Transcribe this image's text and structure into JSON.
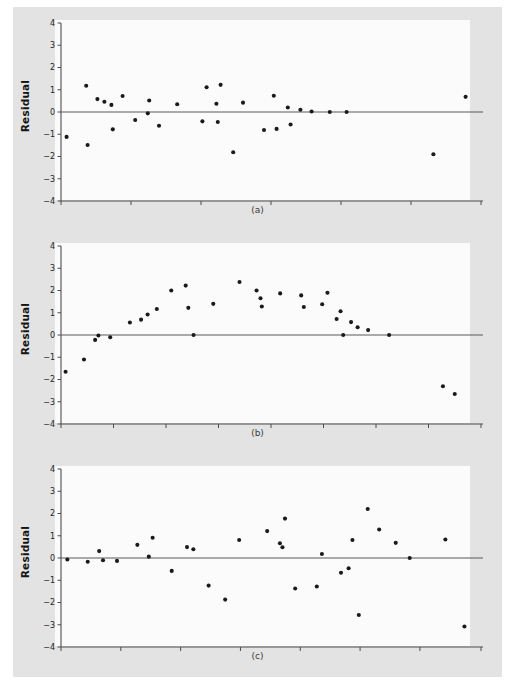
{
  "figure": {
    "background_color": "#e3e3e3",
    "panel_background_color": "#fbfbfb",
    "axis_color": "#4d4d4d",
    "point_color": "#1a1a1a",
    "y_axis_label": "Residual",
    "y_ticks": [
      "4",
      "3",
      "2",
      "1",
      "0",
      "-1",
      "-2",
      "-3",
      "-4"
    ]
  },
  "panels": [
    {
      "caption": "(a)",
      "y_axis_label": "Residual",
      "chart_data": {
        "type": "scatter",
        "title": "",
        "xlabel": "",
        "ylabel": "Residual",
        "ylim": [
          -4,
          4
        ],
        "xlim": [
          0,
          30
        ],
        "yticks": [
          -4,
          -3,
          -2,
          -1,
          0,
          1,
          2,
          3,
          4
        ],
        "ytick_labels": [
          "-4",
          "-3",
          "-2",
          "-1",
          "0",
          "1",
          "2",
          "3",
          "4"
        ],
        "xticks": [
          0,
          5,
          10,
          15,
          20,
          25,
          30
        ],
        "xtick_labels": [
          "",
          "",
          "",
          "",
          "",
          "",
          ""
        ],
        "grid": false,
        "legend": "none",
        "reference_line_y": 0,
        "x": [
          0.4,
          1.8,
          1.9,
          2.6,
          3.1,
          3.6,
          3.7,
          4.4,
          5.3,
          6.2,
          6.3,
          7.0,
          8.3,
          10.1,
          10.4,
          11.1,
          11.2,
          11.4,
          12.3,
          13.0,
          14.5,
          15.2,
          15.4,
          16.2,
          16.4,
          17.1,
          17.9,
          19.2,
          20.4,
          26.6,
          28.9
        ],
        "y": [
          -1.12,
          1.18,
          -1.48,
          0.58,
          0.46,
          0.32,
          -0.78,
          0.72,
          -0.36,
          -0.06,
          0.52,
          -0.62,
          0.35,
          -0.42,
          1.11,
          0.37,
          -0.45,
          1.22,
          -1.81,
          0.42,
          -0.81,
          0.73,
          -0.76,
          0.2,
          -0.56,
          0.1,
          0.02,
          0.0,
          0.0,
          -1.9,
          0.68
        ]
      }
    },
    {
      "caption": "(b)",
      "y_axis_label": "Residual",
      "chart_data": {
        "type": "scatter",
        "title": "",
        "xlabel": "",
        "ylabel": "Residual",
        "ylim": [
          -4,
          4
        ],
        "xlim": [
          0,
          32
        ],
        "yticks": [
          -4,
          -3,
          -2,
          -1,
          0,
          1,
          2,
          3,
          4
        ],
        "ytick_labels": [
          "-4",
          "-3",
          "-2",
          "-1",
          "0",
          "1",
          "2",
          "3",
          "4"
        ],
        "xticks": [
          0,
          4,
          8,
          12,
          16,
          20,
          24,
          28,
          32
        ],
        "xtick_labels": [
          "",
          "",
          "",
          "",
          "",
          "",
          "",
          "",
          ""
        ],
        "grid": false,
        "legend": "none",
        "reference_line_y": 0,
        "x": [
          0.35,
          1.75,
          2.6,
          2.85,
          3.75,
          5.25,
          6.1,
          6.6,
          7.3,
          8.4,
          9.5,
          9.7,
          10.1,
          11.6,
          13.6,
          14.9,
          15.2,
          15.3,
          16.7,
          18.3,
          18.5,
          19.9,
          20.3,
          21.0,
          21.3,
          21.5,
          22.1,
          22.6,
          23.4,
          25.0,
          29.1,
          30.0
        ],
        "y": [
          -1.65,
          -1.1,
          -0.22,
          -0.02,
          -0.1,
          0.56,
          0.69,
          0.92,
          1.17,
          2.0,
          2.22,
          1.22,
          0.0,
          1.4,
          2.38,
          2.0,
          1.65,
          1.28,
          1.87,
          1.78,
          1.26,
          1.38,
          1.9,
          0.72,
          1.07,
          0.0,
          0.58,
          0.35,
          0.22,
          0.0,
          -2.3,
          -2.65
        ]
      }
    },
    {
      "caption": "(c)",
      "y_axis_label": "Residual",
      "chart_data": {
        "type": "scatter",
        "title": "",
        "xlabel": "",
        "ylabel": "Residual",
        "ylim": [
          -4,
          4
        ],
        "xlim": [
          0,
          33
        ],
        "yticks": [
          -4,
          -3,
          -2,
          -1,
          0,
          1,
          2,
          3,
          4
        ],
        "ytick_labels": [
          "-4",
          "-3",
          "-2",
          "-1",
          "0",
          "1",
          "2",
          "3",
          "4"
        ],
        "xticks": [
          0,
          4.7,
          9.4,
          14.1,
          18.8,
          23.5,
          28.2,
          33
        ],
        "xtick_labels": [
          "",
          "",
          "",
          "",
          "",
          "",
          "",
          ""
        ],
        "grid": false,
        "legend": "none",
        "reference_line_y": 0,
        "x": [
          0.5,
          2.1,
          3.0,
          3.3,
          4.4,
          6.0,
          6.9,
          7.2,
          8.7,
          9.9,
          10.4,
          11.6,
          12.9,
          14.0,
          16.2,
          17.2,
          17.4,
          17.6,
          18.4,
          20.1,
          20.5,
          22.0,
          22.6,
          22.9,
          23.4,
          24.1,
          25.0,
          26.3,
          27.4,
          30.2,
          31.7
        ],
        "y": [
          -0.07,
          -0.17,
          0.31,
          -0.1,
          -0.13,
          0.59,
          0.06,
          0.91,
          -0.58,
          0.49,
          0.39,
          -1.24,
          -1.87,
          0.81,
          1.21,
          0.66,
          0.48,
          1.77,
          -1.37,
          -1.28,
          0.18,
          -0.66,
          -0.46,
          0.81,
          -2.56,
          2.2,
          1.28,
          0.68,
          0.0,
          0.83,
          -3.08
        ]
      }
    }
  ]
}
